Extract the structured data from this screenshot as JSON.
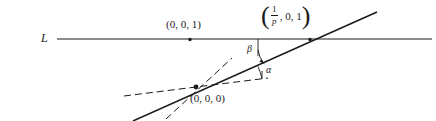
{
  "figure": {
    "type": "geometry-diagram",
    "width": 436,
    "height": 121,
    "background": "#ffffff",
    "stroke_color": "#1a1a1a",
    "text_color": "#1a1a1a"
  },
  "labels": {
    "line_L": "L",
    "point_001": "(0, 0, 1)",
    "point_000": "(0, 0, 0)",
    "angle_alpha": "α",
    "angle_beta": "β"
  },
  "fraction_point": {
    "open_paren": "(",
    "numerator": "1",
    "denominator": "p",
    "rest": ", 0, 1",
    "close_paren": ")"
  },
  "geometry": {
    "horizontal_line_L": {
      "x1": 57,
      "y1": 39,
      "x2": 432,
      "y2": 39
    },
    "solid_slanted_line": {
      "x1": 137,
      "y1": 121,
      "x2": 376,
      "y2": 13
    },
    "dashed_shallow_ray": {
      "x1": 124,
      "y1": 96,
      "x2": 266,
      "y2": 78
    },
    "dashed_steep_line": {
      "x1": 163,
      "y1": 116,
      "x2": 234,
      "y2": 60
    },
    "beta_drop_segment": {
      "x1": 258,
      "y1": 39,
      "x2": 258,
      "y2": 61
    },
    "origin_point": {
      "x": 196,
      "y": 87
    },
    "point_001_marker": {
      "x": 190,
      "y": 39
    },
    "intersection_marker": {
      "x": 310,
      "y": 39
    },
    "alpha_arc_radius": 26,
    "beta_arc": "curved arrow from vertical drop to slanted line"
  }
}
